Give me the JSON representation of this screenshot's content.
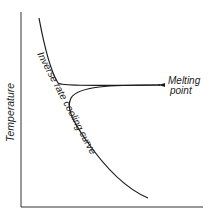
{
  "diagram": {
    "y_axis_label": "Temperature",
    "curve_label": "Inverse rate cooling curve",
    "annotation": {
      "line1": "Melting",
      "line2": "point"
    },
    "colors": {
      "line": "#1a1a1a",
      "text": "#222222",
      "background": "#ffffff"
    }
  }
}
